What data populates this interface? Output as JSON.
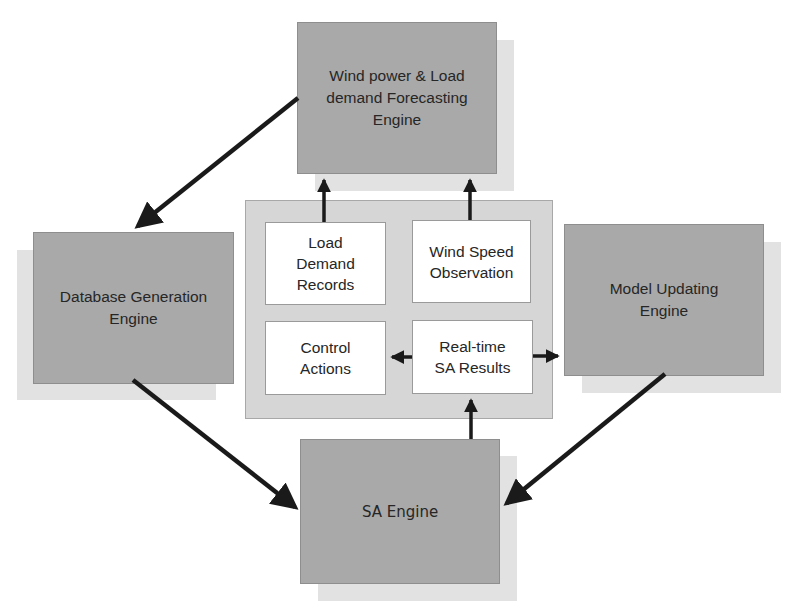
{
  "diagram": {
    "engines": {
      "forecasting": {
        "label": "Wind power & Load\ndemand Forecasting\nEngine"
      },
      "database": {
        "label": "Database Generation\nEngine"
      },
      "model_updating": {
        "label": "Model Updating\nEngine"
      },
      "sa": {
        "label": "SA Engine"
      }
    },
    "center_panel": {
      "boxes": {
        "load_demand": {
          "label": "Load\nDemand\nRecords"
        },
        "wind_speed": {
          "label": "Wind Speed\nObservation"
        },
        "control_actions": {
          "label": "Control\nActions"
        },
        "realtime_sa": {
          "label": "Real-time\nSA Results"
        }
      }
    },
    "connections": [
      {
        "from": "Wind power & Load demand Forecasting Engine",
        "to": "Database Generation Engine"
      },
      {
        "from": "Database Generation Engine",
        "to": "SA Engine"
      },
      {
        "from": "Model Updating Engine",
        "to": "SA Engine"
      },
      {
        "from": "SA Engine",
        "to": "Real-time SA Results"
      },
      {
        "from": "Real-time SA Results",
        "to": "Control Actions"
      },
      {
        "from": "Real-time SA Results",
        "to": "Model Updating Engine"
      },
      {
        "from": "Load Demand Records",
        "to": "Wind power & Load demand Forecasting Engine"
      },
      {
        "from": "Wind Speed Observation",
        "to": "Wind power & Load demand Forecasting Engine"
      }
    ],
    "colors": {
      "engine_fill": "#a9a9a9",
      "shadow": "#e2e2e2",
      "panel_fill": "#d6d6d6",
      "inner_fill": "#ffffff",
      "arrow": "#1a1a1a"
    }
  }
}
